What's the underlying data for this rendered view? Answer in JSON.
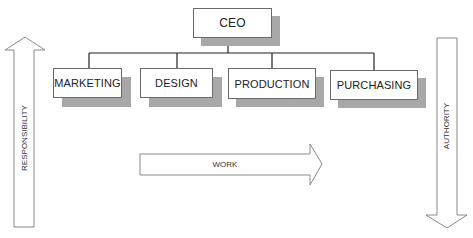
{
  "diagram": {
    "type": "org-chart",
    "root": {
      "label": "CEO"
    },
    "departments": [
      {
        "label": "MARKETING"
      },
      {
        "label": "DESIGN"
      },
      {
        "label": "PRODUCTION"
      },
      {
        "label": "PURCHASING"
      }
    ],
    "arrows": {
      "responsibility": {
        "label": "RESPONSIBILITY",
        "direction": "up"
      },
      "work": {
        "label": "WORK",
        "direction": "right"
      },
      "authority": {
        "label": "AUTHORITY",
        "direction": "down"
      }
    },
    "colors": {
      "box_border": "#6a6a6a",
      "shadow": "#a8a8a8",
      "connector": "#222222",
      "arrow_outline": "#8a8a8a"
    }
  }
}
